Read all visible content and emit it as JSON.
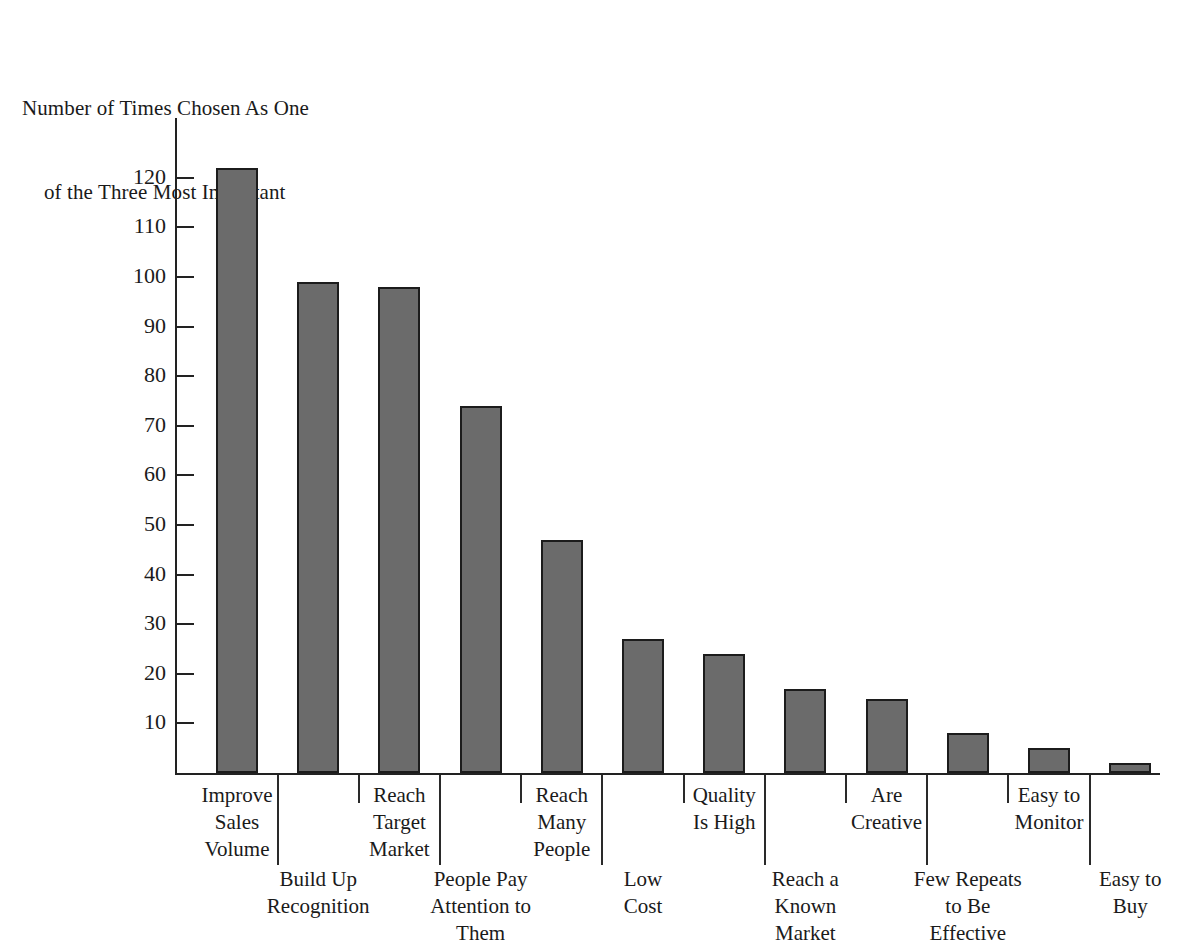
{
  "chart_data": {
    "type": "bar",
    "title": "",
    "subtitle": "",
    "ylabel_line1": "Number of Times Chosen As One",
    "ylabel_line2": "of the Three Most Important",
    "xlabel": "",
    "ylim": [
      0,
      128
    ],
    "ytick_values": [
      10,
      20,
      30,
      40,
      50,
      60,
      70,
      80,
      90,
      100,
      110,
      120
    ],
    "ytick_labels": [
      "10",
      "20",
      "30",
      "40",
      "50",
      "60",
      "70",
      "80",
      "90",
      "100",
      "110",
      "120"
    ],
    "grid": false,
    "legend": "none",
    "bar_color": "#6b6b6b",
    "bar_edge_color": "#1c1c1c",
    "axis_color": "#222222",
    "categories": [
      "Improve\nSales\nVolume",
      "Build Up\nRecognition",
      "Reach\nTarget\nMarket",
      "People Pay\nAttention to\nThem",
      "Reach\nMany\nPeople",
      "Low\nCost",
      "Quality\nIs High",
      "Reach a\nKnown\nMarket",
      "Are\nCreative",
      "Few Repeats\nto Be\nEffective",
      "Easy to\nMonitor",
      "Easy to\nBuy"
    ],
    "values": [
      122,
      99,
      98,
      74,
      47,
      27,
      24,
      17,
      15,
      8,
      5,
      2
    ]
  }
}
